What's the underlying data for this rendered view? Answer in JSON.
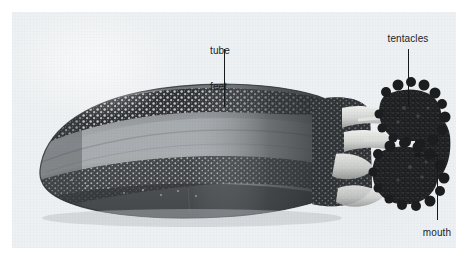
{
  "figure": {
    "type": "labeled-photograph",
    "background_color": "#ffffff",
    "plate_color": "#eef1f3",
    "label_color": "#1b1d1f"
  },
  "labels": {
    "tube_feet": {
      "text": "tube\nfeet",
      "line1": "tube",
      "line2": "feet",
      "leader": "vertical"
    },
    "tentacles": {
      "text": "tentacles",
      "leader": "vertical"
    },
    "mouth": {
      "text": "mouth",
      "leader": "elbow-with-arrow"
    }
  }
}
